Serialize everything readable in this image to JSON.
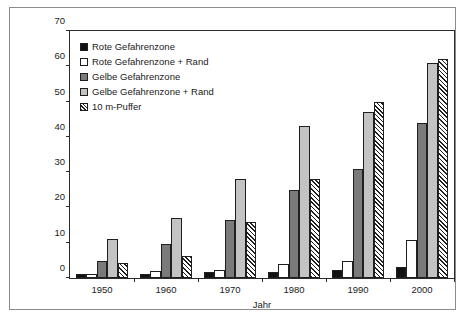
{
  "chart_data": {
    "type": "bar",
    "title": "",
    "xlabel": "Jahr",
    "ylabel": "Gebäudewerte [Mio. €]",
    "categories": [
      "1950",
      "1960",
      "1970",
      "1980",
      "1990",
      "2000"
    ],
    "ylim": [
      0,
      70
    ],
    "yticks": [
      0,
      10,
      20,
      30,
      40,
      50,
      60,
      70
    ],
    "grid": false,
    "legend_position": "top-left",
    "series": [
      {
        "name": "Rote Gefahrenzone",
        "swatch": "black-filled-swatch",
        "color": "#111111",
        "values": [
          1.0,
          1.1,
          1.8,
          1.8,
          2.3,
          3.2
        ]
      },
      {
        "name": "Rote Gefahrenzone + Rand",
        "swatch": "white-empty-swatch",
        "color": "#ffffff",
        "values": [
          1.1,
          1.9,
          2.4,
          4.0,
          4.7,
          10.9
        ]
      },
      {
        "name": "Gelbe Gefahrenzone",
        "swatch": "dark-gray-swatch",
        "color": "#7a7a7a",
        "values": [
          4.7,
          9.5,
          16.5,
          25.0,
          30.8,
          43.9
        ]
      },
      {
        "name": "Gelbe Gefahrenzone + Rand",
        "swatch": "light-gray-swatch",
        "color": "#c3c3c3",
        "values": [
          11.0,
          17.0,
          28.0,
          43.0,
          47.0,
          61.0
        ]
      },
      {
        "name": "10 m-Puffer",
        "swatch": "hatched-swatch",
        "color": "#ffffff",
        "values": [
          4.2,
          6.2,
          15.9,
          28.0,
          50.0,
          62.0
        ]
      }
    ]
  }
}
